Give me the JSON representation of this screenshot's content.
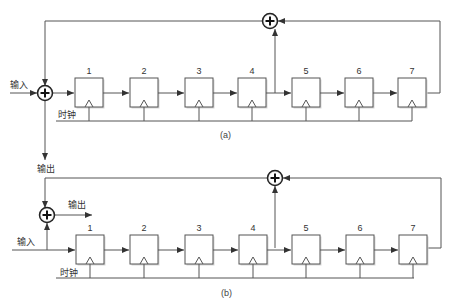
{
  "diagrams": [
    {
      "id": "a",
      "caption": "(a)",
      "input_label": "输入",
      "clock_label": "时钟",
      "output_label": "输出",
      "registers": [
        "1",
        "2",
        "3",
        "4",
        "5",
        "6",
        "7"
      ],
      "tap_after_register": "4",
      "feedback_from_register": "7"
    },
    {
      "id": "b",
      "caption": "(b)",
      "input_label": "输入",
      "clock_label": "时钟",
      "output_label": "输出",
      "registers": [
        "1",
        "2",
        "3",
        "4",
        "5",
        "6",
        "7"
      ],
      "tap_after_register": "4",
      "feedback_from_register": "7"
    }
  ],
  "colors": {
    "wire": "#555555",
    "box_stroke": "#555555",
    "text": "#333333"
  }
}
